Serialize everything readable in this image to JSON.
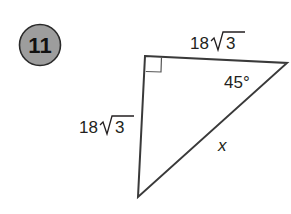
{
  "problem": {
    "number": "11",
    "badge_fill": "#9d9d9d",
    "badge_stroke": "#2a2a2a"
  },
  "triangle": {
    "stroke": "#3a3a3a",
    "right_angle_marker": true,
    "labels": {
      "top_side": {
        "coef": "18",
        "radicand": "3"
      },
      "left_side": {
        "coef": "18",
        "radicand": "3"
      },
      "angle": "45°",
      "hypotenuse": "x"
    }
  }
}
